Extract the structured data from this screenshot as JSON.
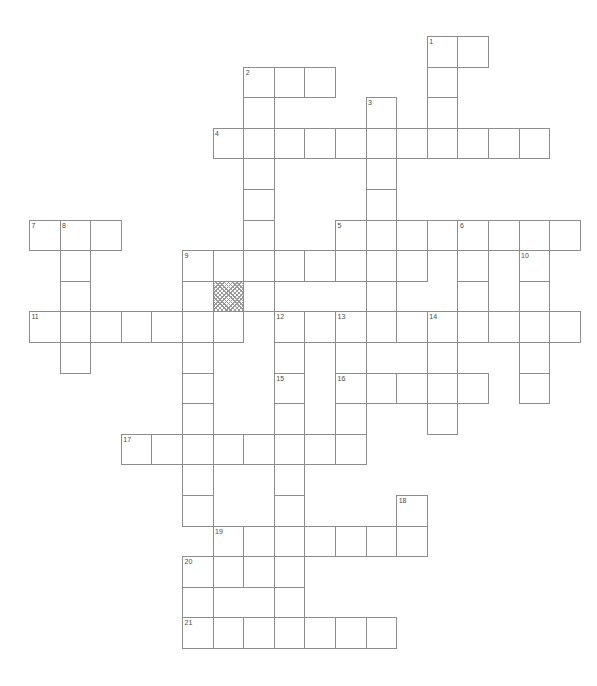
{
  "page": {
    "width": 597,
    "height": 686,
    "background_color": "#ffffff",
    "header_mark": ""
  },
  "grid": {
    "cell_size": 30.6,
    "origin_x": 29,
    "origin_y": 36,
    "line_color": "#8d8d8d",
    "cell_fill": "#ffffff",
    "shaded_fill": "#9a9a9a",
    "number_color": "#4a4a4a",
    "number_font_size": 7,
    "columns": 18,
    "rows": 21,
    "shaded_cells": [
      [
        6,
        8
      ]
    ],
    "entries": [
      {
        "number": "1",
        "direction": "across",
        "col": 13,
        "row": 0,
        "length": 2
      },
      {
        "number": "1",
        "direction": "down",
        "col": 13,
        "row": 0,
        "length": 3
      },
      {
        "number": "2",
        "direction": "down",
        "col": 7,
        "row": 1,
        "length": 9
      },
      {
        "number": "2",
        "direction": "across",
        "col": 7,
        "row": 1,
        "length": 3
      },
      {
        "number": "3",
        "direction": "down",
        "col": 11,
        "row": 2,
        "length": 5
      },
      {
        "number": "4",
        "direction": "across",
        "col": 6,
        "row": 3,
        "length": 11
      },
      {
        "number": "5",
        "direction": "across",
        "col": 10,
        "row": 6,
        "length": 8
      },
      {
        "number": "6",
        "direction": "down",
        "col": 14,
        "row": 6,
        "length": 3
      },
      {
        "number": "7",
        "direction": "across",
        "col": 0,
        "row": 6,
        "length": 3
      },
      {
        "number": "8",
        "direction": "down",
        "col": 1,
        "row": 6,
        "length": 5
      },
      {
        "number": "9",
        "direction": "across",
        "col": 5,
        "row": 7,
        "length": 8
      },
      {
        "number": "10",
        "direction": "down",
        "col": 16,
        "row": 7,
        "length": 6
      },
      {
        "number": "11",
        "direction": "across",
        "col": 0,
        "row": 9,
        "length": 7
      },
      {
        "number": "12",
        "direction": "across",
        "col": 8,
        "row": 9,
        "length": 10
      },
      {
        "number": "13",
        "direction": "label",
        "col": 10,
        "row": 9,
        "length": 1
      },
      {
        "number": "14",
        "direction": "label",
        "col": 13,
        "row": 9,
        "length": 1
      },
      {
        "number": "15",
        "direction": "down",
        "col": 8,
        "row": 11,
        "length": 5
      },
      {
        "number": "16",
        "direction": "across",
        "col": 10,
        "row": 11,
        "length": 6
      },
      {
        "number": "17",
        "direction": "across",
        "col": 3,
        "row": 13,
        "length": 8
      },
      {
        "number": "18",
        "direction": "down",
        "col": 12,
        "row": 15,
        "length": 2
      },
      {
        "number": "19",
        "direction": "across",
        "col": 6,
        "row": 16,
        "length": 7
      },
      {
        "number": "20",
        "direction": "down",
        "col": 5,
        "row": 17,
        "length": 3
      },
      {
        "number": "21",
        "direction": "across",
        "col": 5,
        "row": 19,
        "length": 7
      }
    ],
    "cells": [
      {
        "col": 13,
        "row": 0,
        "number": "1"
      },
      {
        "col": 14,
        "row": 0
      },
      {
        "col": 7,
        "row": 1,
        "number": "2"
      },
      {
        "col": 8,
        "row": 1
      },
      {
        "col": 9,
        "row": 1
      },
      {
        "col": 13,
        "row": 1
      },
      {
        "col": 7,
        "row": 2
      },
      {
        "col": 11,
        "row": 2,
        "number": "3"
      },
      {
        "col": 13,
        "row": 2
      },
      {
        "col": 6,
        "row": 3,
        "number": "4"
      },
      {
        "col": 7,
        "row": 3
      },
      {
        "col": 8,
        "row": 3
      },
      {
        "col": 9,
        "row": 3
      },
      {
        "col": 10,
        "row": 3
      },
      {
        "col": 11,
        "row": 3
      },
      {
        "col": 12,
        "row": 3
      },
      {
        "col": 13,
        "row": 3
      },
      {
        "col": 14,
        "row": 3
      },
      {
        "col": 15,
        "row": 3
      },
      {
        "col": 16,
        "row": 3
      },
      {
        "col": 7,
        "row": 4
      },
      {
        "col": 11,
        "row": 4
      },
      {
        "col": 7,
        "row": 5
      },
      {
        "col": 11,
        "row": 5
      },
      {
        "col": 0,
        "row": 6,
        "number": "7"
      },
      {
        "col": 1,
        "row": 6,
        "number": "8"
      },
      {
        "col": 2,
        "row": 6
      },
      {
        "col": 7,
        "row": 6
      },
      {
        "col": 10,
        "row": 6,
        "number": "5"
      },
      {
        "col": 11,
        "row": 6
      },
      {
        "col": 12,
        "row": 6
      },
      {
        "col": 13,
        "row": 6
      },
      {
        "col": 14,
        "row": 6,
        "number": "6"
      },
      {
        "col": 15,
        "row": 6
      },
      {
        "col": 16,
        "row": 6
      },
      {
        "col": 17,
        "row": 6
      },
      {
        "col": 1,
        "row": 7
      },
      {
        "col": 5,
        "row": 7,
        "number": "9"
      },
      {
        "col": 6,
        "row": 7
      },
      {
        "col": 7,
        "row": 7
      },
      {
        "col": 8,
        "row": 7
      },
      {
        "col": 9,
        "row": 7
      },
      {
        "col": 10,
        "row": 7
      },
      {
        "col": 11,
        "row": 7
      },
      {
        "col": 12,
        "row": 7
      },
      {
        "col": 14,
        "row": 7
      },
      {
        "col": 16,
        "row": 7,
        "number": "10"
      },
      {
        "col": 1,
        "row": 8
      },
      {
        "col": 5,
        "row": 8
      },
      {
        "col": 6,
        "row": 8,
        "shaded": true
      },
      {
        "col": 7,
        "row": 8
      },
      {
        "col": 11,
        "row": 8
      },
      {
        "col": 14,
        "row": 8
      },
      {
        "col": 16,
        "row": 8
      },
      {
        "col": 0,
        "row": 9,
        "number": "11"
      },
      {
        "col": 1,
        "row": 9
      },
      {
        "col": 2,
        "row": 9
      },
      {
        "col": 3,
        "row": 9
      },
      {
        "col": 4,
        "row": 9
      },
      {
        "col": 5,
        "row": 9
      },
      {
        "col": 6,
        "row": 9
      },
      {
        "col": 8,
        "row": 9,
        "number": "12"
      },
      {
        "col": 9,
        "row": 9
      },
      {
        "col": 10,
        "row": 9,
        "number": "13"
      },
      {
        "col": 11,
        "row": 9
      },
      {
        "col": 12,
        "row": 9
      },
      {
        "col": 13,
        "row": 9,
        "number": "14"
      },
      {
        "col": 14,
        "row": 9
      },
      {
        "col": 15,
        "row": 9
      },
      {
        "col": 16,
        "row": 9
      },
      {
        "col": 17,
        "row": 9
      },
      {
        "col": 1,
        "row": 10
      },
      {
        "col": 5,
        "row": 10
      },
      {
        "col": 8,
        "row": 10
      },
      {
        "col": 10,
        "row": 10
      },
      {
        "col": 13,
        "row": 10
      },
      {
        "col": 16,
        "row": 10
      },
      {
        "col": 5,
        "row": 11
      },
      {
        "col": 8,
        "row": 11,
        "number": "15"
      },
      {
        "col": 10,
        "row": 11,
        "number": "16"
      },
      {
        "col": 11,
        "row": 11
      },
      {
        "col": 12,
        "row": 11
      },
      {
        "col": 13,
        "row": 11
      },
      {
        "col": 14,
        "row": 11
      },
      {
        "col": 16,
        "row": 11
      },
      {
        "col": 5,
        "row": 12
      },
      {
        "col": 8,
        "row": 12
      },
      {
        "col": 10,
        "row": 12
      },
      {
        "col": 13,
        "row": 12
      },
      {
        "col": 3,
        "row": 13,
        "number": "17"
      },
      {
        "col": 4,
        "row": 13
      },
      {
        "col": 5,
        "row": 13
      },
      {
        "col": 6,
        "row": 13
      },
      {
        "col": 7,
        "row": 13
      },
      {
        "col": 8,
        "row": 13
      },
      {
        "col": 9,
        "row": 13
      },
      {
        "col": 10,
        "row": 13
      },
      {
        "col": 5,
        "row": 14
      },
      {
        "col": 8,
        "row": 14
      },
      {
        "col": 5,
        "row": 15
      },
      {
        "col": 8,
        "row": 15
      },
      {
        "col": 12,
        "row": 15,
        "number": "18"
      },
      {
        "col": 6,
        "row": 16,
        "number": "19"
      },
      {
        "col": 7,
        "row": 16
      },
      {
        "col": 8,
        "row": 16
      },
      {
        "col": 9,
        "row": 16
      },
      {
        "col": 10,
        "row": 16
      },
      {
        "col": 11,
        "row": 16
      },
      {
        "col": 12,
        "row": 16
      },
      {
        "col": 5,
        "row": 17,
        "number": "20"
      },
      {
        "col": 6,
        "row": 17
      },
      {
        "col": 7,
        "row": 17
      },
      {
        "col": 8,
        "row": 17
      },
      {
        "col": 5,
        "row": 18
      },
      {
        "col": 8,
        "row": 18
      },
      {
        "col": 5,
        "row": 19,
        "number": "21"
      },
      {
        "col": 6,
        "row": 19
      },
      {
        "col": 7,
        "row": 19
      },
      {
        "col": 8,
        "row": 19
      },
      {
        "col": 9,
        "row": 19
      },
      {
        "col": 10,
        "row": 19
      },
      {
        "col": 11,
        "row": 19
      }
    ]
  }
}
